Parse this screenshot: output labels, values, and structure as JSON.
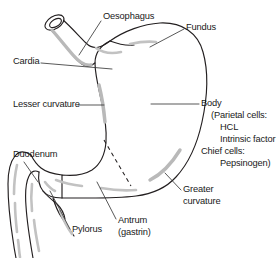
{
  "figure": {
    "background_color": "#ffffff",
    "outline_color": "#231f20",
    "highlight_color": "#b9b9b9",
    "text_color": "#1a1a1a"
  },
  "labels": {
    "oesophagus": "Oesophagus",
    "fundus": "Fundus",
    "cardia": "Cardia",
    "lesser_curvature": "Lesser curvature",
    "duodenum": "Duodenum",
    "pylorus": "Pylorus",
    "antrum_line1": "Antrum",
    "antrum_line2": "(gastrin)",
    "greater_curvature_line1": "Greater",
    "greater_curvature_line2": "curvature",
    "body": "Body"
  },
  "body_detail": {
    "line1": "(Parietal cells:",
    "line2": "HCL",
    "line3": "Intrinsic factor",
    "line4": "Chief cells:",
    "line5": "Pepsinogen)"
  },
  "structures": [
    {
      "name": "oesophagus",
      "kind": "tube"
    },
    {
      "name": "cardia",
      "kind": "junction"
    },
    {
      "name": "fundus",
      "kind": "region"
    },
    {
      "name": "body",
      "kind": "region"
    },
    {
      "name": "lesser-curvature",
      "kind": "border"
    },
    {
      "name": "greater-curvature",
      "kind": "border"
    },
    {
      "name": "antrum",
      "kind": "region"
    },
    {
      "name": "pylorus",
      "kind": "sphincter"
    },
    {
      "name": "duodenum",
      "kind": "tube"
    }
  ]
}
